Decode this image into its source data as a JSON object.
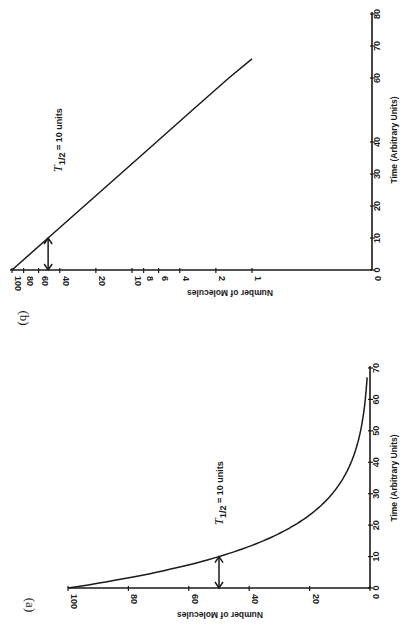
{
  "figure": {
    "orientation": "rotated 90 degrees clockwise",
    "panels": [
      "(b)",
      "(a)"
    ]
  },
  "chart_data": [
    {
      "panel_label": "(b)",
      "type": "line",
      "title": "",
      "xlabel": "Time (Arbitrary Units)",
      "ylabel": "Number of Molecules",
      "yscale": "log",
      "x_ticks": [
        "0",
        "10",
        "20",
        "30",
        "40",
        "60",
        "70",
        "80"
      ],
      "x_tick_values": [
        0,
        10,
        20,
        30,
        40,
        50,
        60,
        70,
        80
      ],
      "y_ticks": [
        "100",
        "80",
        "60",
        "40",
        "20",
        "10",
        "8",
        "6",
        "4",
        "2",
        "1",
        "0"
      ],
      "xlim": [
        0,
        80
      ],
      "ylim": [
        1,
        100
      ],
      "series": [
        {
          "name": "N(t)",
          "x": [
            0,
            10,
            20,
            30,
            40,
            50,
            60,
            66
          ],
          "values": [
            100,
            50,
            25,
            12.5,
            6.25,
            3.13,
            1.56,
            1
          ]
        }
      ],
      "annotations": [
        {
          "text": "T1/2 = 10 units",
          "arrow": {
            "x": 10,
            "from": 100,
            "to": 50,
            "style": "double-headed",
            "between": "y-axis at N=50 and the line"
          }
        }
      ],
      "grid": false
    },
    {
      "panel_label": "(a)",
      "type": "line",
      "title": "",
      "xlabel": "Time (Arbitrary Units)",
      "ylabel": "Number of Molecules",
      "yscale": "linear",
      "x_ticks": [
        "0",
        "10",
        "20",
        "30",
        "40",
        "50",
        "60",
        "70"
      ],
      "y_ticks": [
        "100",
        "80",
        "60",
        "40",
        "20",
        "0"
      ],
      "xlim": [
        0,
        70
      ],
      "ylim": [
        0,
        100
      ],
      "series": [
        {
          "name": "N(t)",
          "x": [
            0,
            5,
            10,
            15,
            20,
            25,
            30,
            35,
            40,
            45,
            50,
            55,
            60,
            65,
            67
          ],
          "values": [
            100,
            70.7,
            50,
            35.4,
            25,
            17.7,
            12.5,
            8.8,
            6.3,
            4.4,
            3.1,
            2.2,
            1.6,
            1.1,
            1.0
          ]
        }
      ],
      "annotations": [
        {
          "text": "T1/2 = 10 units",
          "arrow": {
            "x": 10,
            "from": 0,
            "to": 50,
            "style": "double-headed"
          }
        }
      ],
      "grid": false
    }
  ],
  "labels": {
    "b": {
      "panel": "(b)",
      "ylabel": "Number of Molecules",
      "xlabel": "Time (Arbitrary Units)",
      "half_life_T": "T",
      "half_life_sub": "1/2",
      "half_life_rest": "= 10 units",
      "time_ticks": [
        "0",
        "10",
        "20",
        "30",
        "40",
        "60",
        "70",
        "80"
      ],
      "n_ticks": [
        "100",
        "80",
        "60",
        "40",
        "20",
        "10",
        "8",
        "6",
        "4",
        "2",
        "1",
        "0"
      ]
    },
    "a": {
      "panel": "(a)",
      "ylabel": "Number of Molecules",
      "xlabel": "Time (Arbitrary Units)",
      "half_life_T": "T",
      "half_life_sub": "1/2",
      "half_life_rest": "= 10 units",
      "time_ticks": [
        "0",
        "10",
        "20",
        "30",
        "40",
        "50",
        "60",
        "70"
      ],
      "n_ticks": [
        "100",
        "80",
        "60",
        "40",
        "20",
        "0"
      ]
    }
  },
  "colors": {
    "ink": "#1a1a1a",
    "paper": "#ffffff"
  }
}
